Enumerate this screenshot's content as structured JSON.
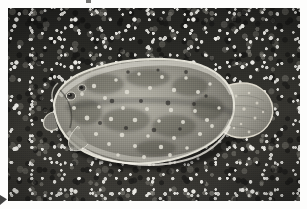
{
  "media": {
    "kind": "photograph",
    "color_mode": "grayscale",
    "orientation": "landscape",
    "border": "white photographic print border",
    "width_px": 307,
    "height_px": 209
  },
  "scene": {
    "subject": "flatfish-on-gravel-seabed",
    "subject_common_name": "flounder",
    "background": "coarse pebble and shell gravel substrate",
    "lighting": "direct overhead flash",
    "fish_orientation": "head-left, tail-right, viewed from above on eyed side"
  },
  "subject": {
    "body_label": "flatfish-body",
    "head_label": "fish-head",
    "eye_label": "fish-eye",
    "tail_label": "caudal-fin",
    "dorsal_fin_label": "dorsal-fin",
    "anal_fin_label": "anal-fin",
    "pectoral_fin_label": "pectoral-fin",
    "spots_label": "body-spotting"
  },
  "artifacts": {
    "top_speck": "dark-speck",
    "bottom_left_mark": "corner-mark"
  },
  "colors": {
    "print_border": "#fdfdfc",
    "substrate_dark": "#1f1f1d",
    "substrate_mid": "#35342f",
    "gravel_highlight": "#f8f7f2",
    "fish_body_light": "#b9b7ac",
    "fish_body_mid": "#8e8c83",
    "fish_body_dark": "#5c5a54",
    "fish_rim_light": "#e6e4da",
    "fish_spot_light": "#d8d6cb",
    "fish_spot_dark": "#3a3935"
  }
}
